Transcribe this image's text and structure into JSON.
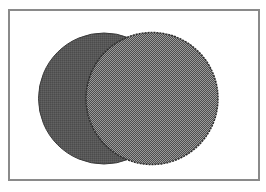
{
  "diagram": {
    "type": "venn",
    "frame": {
      "x": 8,
      "y": 9,
      "width": 250,
      "height": 170,
      "border_color": "#8a8a8a",
      "background": "#ffffff"
    },
    "circles": [
      {
        "id": "left",
        "cx": 104,
        "cy": 98.5,
        "r": 65.5,
        "fill": "#555555",
        "stroke": "#3a3a3a",
        "pattern": "solid-dither"
      },
      {
        "id": "right",
        "cx": 152,
        "cy": 98.5,
        "r": 66,
        "fill_dark": "#4e4e4e",
        "fill_light": "#9a9a9a",
        "stroke": "#2e2e2e",
        "pattern": "checker-dither"
      }
    ]
  }
}
